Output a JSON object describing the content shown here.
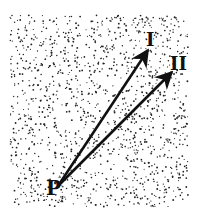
{
  "diagram": {
    "region": {
      "x": 10,
      "y": 15,
      "width": 178,
      "height": 192,
      "dot_color": "#222222",
      "dot_count": 1400
    },
    "origin": {
      "label": "P",
      "x": 58,
      "y": 186,
      "label_x": 46,
      "label_y": 178
    },
    "vectors": [
      {
        "label": "I",
        "tip_x": 148,
        "tip_y": 50,
        "label_x": 146,
        "label_y": 31
      },
      {
        "label": "II",
        "tip_x": 172,
        "tip_y": 72,
        "label_x": 170,
        "label_y": 55
      }
    ],
    "arrow_color": "#111111"
  }
}
